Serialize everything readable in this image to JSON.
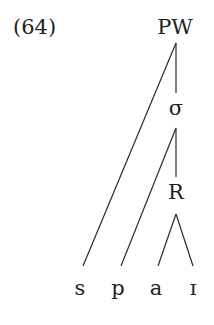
{
  "example_number": "(64)",
  "tree": {
    "root": "PW",
    "syllable": "σ",
    "rhyme": "R",
    "segments": [
      "s",
      "p",
      "a",
      "ɪ"
    ]
  },
  "colors": {
    "ink": "#222222",
    "background": "#ffffff"
  }
}
